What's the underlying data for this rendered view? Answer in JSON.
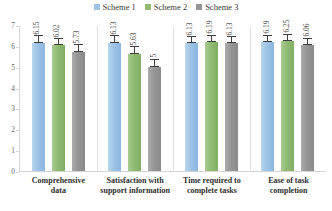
{
  "chart_data": {
    "type": "bar",
    "title": "",
    "subtitle": "",
    "xlabel": "",
    "ylabel": "",
    "ylim": [
      0,
      7
    ],
    "yticks": [
      7,
      6,
      5,
      4,
      3,
      2,
      1,
      0
    ],
    "grid": false,
    "legend_position": "top-center",
    "error_bars": true,
    "categories": [
      "Comprehensive data",
      "Satisfaction with support information",
      "Time required to complete tasks",
      "Ease of task completion"
    ],
    "series": [
      {
        "name": "Scheme 1",
        "color": "#9dc3e6",
        "values": [
          6.15,
          6.13,
          6.13,
          6.19
        ],
        "labels": [
          "6.15",
          "6.13",
          "6.13",
          "6.19"
        ],
        "errors": [
          0.32,
          0.33,
          0.28,
          0.3
        ]
      },
      {
        "name": "Scheme 2",
        "color": "#8fbc72",
        "values": [
          6.02,
          5.63,
          6.19,
          6.25
        ],
        "labels": [
          "6.02",
          "5.63",
          "6.19",
          "6.25"
        ],
        "errors": [
          0.3,
          0.3,
          0.3,
          0.28
        ]
      },
      {
        "name": "Scheme 3",
        "color": "#969696",
        "values": [
          5.73,
          5.0,
          6.13,
          6.06
        ],
        "labels": [
          "5.73",
          "5",
          "6.13",
          "6.06"
        ],
        "errors": [
          0.3,
          0.33,
          0.28,
          0.28
        ]
      }
    ]
  },
  "legend": {
    "items": [
      {
        "label": "Scheme 1",
        "color": "#9dc3e6"
      },
      {
        "label": "Scheme 2",
        "color": "#8fbc72"
      },
      {
        "label": "Scheme 3",
        "color": "#969696"
      }
    ]
  },
  "axis": {
    "y_tick_labels": [
      "7",
      "6",
      "5",
      "4",
      "3",
      "2",
      "1",
      "0"
    ]
  },
  "categories_display": [
    {
      "line1": "Comprehensive",
      "line2": "data"
    },
    {
      "line1": "Satisfaction with",
      "line2": "support information"
    },
    {
      "line1": "Time required to",
      "line2": "complete tasks"
    },
    {
      "line1": "Ease of task",
      "line2": "completion"
    }
  ]
}
